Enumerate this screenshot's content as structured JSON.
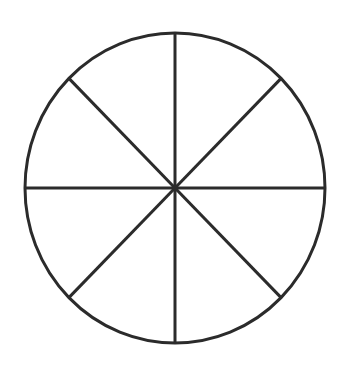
{
  "diagram": {
    "title": "",
    "shape": "circle",
    "slices": 8,
    "stroke_color": "#2b2b2b",
    "fill_color": "#ffffff",
    "stroke_width": 3,
    "center": {
      "x": 175,
      "y": 188
    },
    "radius_x": 150,
    "radius_y": 155,
    "divider_angles_deg": [
      0,
      45,
      90,
      135,
      180,
      225,
      270,
      315
    ]
  }
}
